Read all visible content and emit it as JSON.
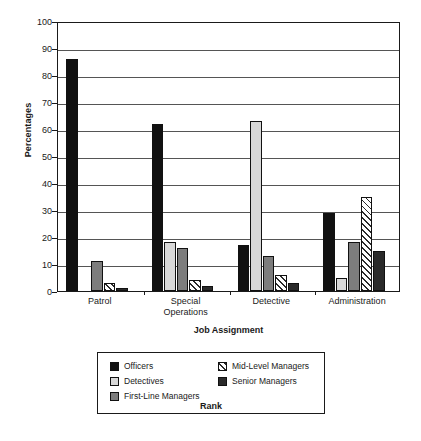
{
  "chart_data": {
    "type": "bar",
    "title": "",
    "xlabel": "Job Assignment",
    "ylabel": "Percentages",
    "ylim": [
      0,
      100
    ],
    "yticks": [
      0,
      10,
      20,
      30,
      40,
      50,
      60,
      70,
      80,
      90,
      100
    ],
    "grid": true,
    "legend_position": "below-chart",
    "legend_title": "Rank",
    "categories": [
      "Patrol",
      "Special Operations",
      "Detective",
      "Administration"
    ],
    "category_lines": [
      [
        "Patrol"
      ],
      [
        "Special",
        "Operations"
      ],
      [
        "Detective"
      ],
      [
        "Administration"
      ]
    ],
    "series": [
      {
        "name": "Officers",
        "key": "officers",
        "color": "#111111",
        "pattern": "solid",
        "values": [
          86,
          62,
          17,
          29
        ]
      },
      {
        "name": "Detectives",
        "key": "detectives",
        "color": "#d8d8d8",
        "pattern": "solid",
        "values": [
          0,
          18,
          63,
          5
        ]
      },
      {
        "name": "First-Line Managers",
        "key": "firstline",
        "color": "#7d7d7d",
        "pattern": "solid",
        "values": [
          11,
          16,
          13,
          18
        ]
      },
      {
        "name": "Mid-Level Managers",
        "key": "midlevel",
        "color": "#ffffff",
        "pattern": "diagonal",
        "values": [
          3,
          4,
          6,
          35
        ]
      },
      {
        "name": "Senior Managers",
        "key": "senior",
        "color": "#2a2a2a",
        "pattern": "solid",
        "values": [
          1,
          2,
          3,
          15
        ]
      }
    ]
  },
  "axis": {
    "y_title": "Percentages",
    "x_title": "Job Assignment",
    "y_tick_labels": [
      "100",
      "90",
      "80",
      "70",
      "60",
      "50",
      "40",
      "30",
      "20",
      "10",
      "0"
    ]
  },
  "legend": {
    "title": "Rank",
    "items": [
      {
        "label": "Officers",
        "swatch": "officers"
      },
      {
        "label": "Detectives",
        "swatch": "detectives"
      },
      {
        "label": "First-Line Managers",
        "swatch": "firstline"
      },
      {
        "label": "Mid-Level Managers",
        "swatch": "midlevel"
      },
      {
        "label": "Senior Managers",
        "swatch": "senior"
      }
    ]
  },
  "colors": {
    "officers": "#111111",
    "detectives": "#d8d8d8",
    "firstline": "#7d7d7d",
    "midlevel": "#ffffff",
    "senior": "#2a2a2a",
    "grid": "#555555",
    "axis": "#1a1a1a",
    "background": "#ffffff"
  }
}
